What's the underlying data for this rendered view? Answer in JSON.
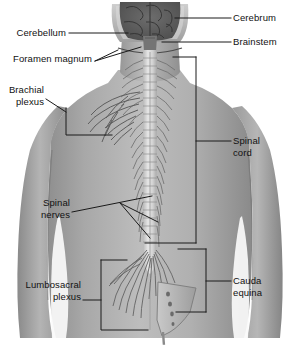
{
  "figure": {
    "view": "posterior",
    "style": "grayscale anatomical illustration",
    "background_color": "#ffffff",
    "label_color": "#111111",
    "leader_line_color": "#1a1a1a"
  },
  "labels": {
    "cerebrum": "Cerebrum",
    "brainstem": "Brainstem",
    "cerebellum": "Cerebellum",
    "foramen_magnum": "Foramen magnum",
    "brachial_plexus_line1": "Brachial",
    "brachial_plexus_line2": "plexus",
    "spinal_cord_line1": "Spinal",
    "spinal_cord_line2": "cord",
    "spinal_nerves_line1": "Spinal",
    "spinal_nerves_line2": "nerves",
    "cauda_equina_line1": "Cauda",
    "cauda_equina_line2": "equina",
    "lumbosacral_plexus_line1": "Lumbosacral",
    "lumbosacral_plexus_line2": "plexus"
  },
  "structures": [
    {
      "name": "cerebrum",
      "side": "right",
      "marker": "leader-line"
    },
    {
      "name": "brainstem",
      "side": "right",
      "marker": "leader-line"
    },
    {
      "name": "cerebellum",
      "side": "left",
      "marker": "leader-line"
    },
    {
      "name": "foramen-magnum",
      "side": "left",
      "marker": "leader-line"
    },
    {
      "name": "brachial-plexus",
      "side": "left",
      "marker": "bracket"
    },
    {
      "name": "spinal-cord",
      "side": "right",
      "marker": "bracket"
    },
    {
      "name": "spinal-nerves",
      "side": "left",
      "marker": "multi-leader"
    },
    {
      "name": "cauda-equina",
      "side": "right",
      "marker": "bracket"
    },
    {
      "name": "lumbosacral-plexus",
      "side": "left",
      "marker": "bracket"
    }
  ]
}
